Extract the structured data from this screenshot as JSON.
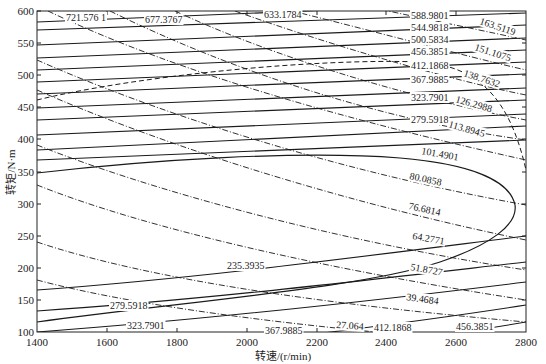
{
  "chart_data": {
    "type": "contour",
    "title": "",
    "xlabel": "转速/(r/min)",
    "ylabel": "转矩/N·m",
    "xlim": [
      1400,
      2800
    ],
    "ylim": [
      100,
      600
    ],
    "xticks": [
      1400,
      1600,
      1800,
      2000,
      2200,
      2400,
      2600,
      2800
    ],
    "yticks": [
      100,
      150,
      200,
      250,
      300,
      350,
      400,
      450,
      500,
      550,
      600
    ],
    "grid": false,
    "series": [
      {
        "name": "solid-contours",
        "style": "solid",
        "levels": [
          721.5761,
          677.3767,
          633.1784,
          588.9801,
          544.9818,
          500.5834,
          456.3851,
          412.1868,
          367.9885,
          323.7901,
          279.5918,
          235.3935
        ],
        "labels": [
          {
            "text": "721.576 1",
            "x": 1650,
            "y": 593
          },
          {
            "text": "677.3767",
            "x": 1950,
            "y": 585
          },
          {
            "text": "633.1784",
            "x": 2200,
            "y": 592
          },
          {
            "text": "588.9801",
            "x": 2480,
            "y": 587
          },
          {
            "text": "544.9818",
            "x": 2480,
            "y": 565
          },
          {
            "text": "500.5834",
            "x": 2480,
            "y": 542
          },
          {
            "text": "456.3851",
            "x": 2480,
            "y": 518
          },
          {
            "text": "412.1868",
            "x": 2480,
            "y": 493
          },
          {
            "text": "367.9885",
            "x": 2480,
            "y": 470
          },
          {
            "text": "323.7901",
            "x": 2480,
            "y": 440
          },
          {
            "text": "279.5918",
            "x": 2480,
            "y": 408
          },
          {
            "text": "235.3935",
            "x": 2000,
            "y": 198
          },
          {
            "text": "279.5918",
            "x": 1650,
            "y": 147
          },
          {
            "text": "323.7901",
            "x": 1700,
            "y": 113
          },
          {
            "text": "367.9885",
            "x": 2160,
            "y": 107
          },
          {
            "text": "412.1868",
            "x": 2410,
            "y": 110
          },
          {
            "text": "456.3851",
            "x": 2650,
            "y": 110
          }
        ]
      },
      {
        "name": "dashdot-contours",
        "style": "dash-dot",
        "levels": [
          163.5119,
          151.1075,
          138.7632,
          126.2988,
          113.8945,
          101.4901,
          80.0858,
          76.6814,
          64.2771,
          51.8727,
          39.4684,
          27.064
        ],
        "labels": [
          {
            "text": "163.5119",
            "x": 2710,
            "y": 585
          },
          {
            "text": "151.1075",
            "x": 2700,
            "y": 524
          },
          {
            "text": "138.7632",
            "x": 2680,
            "y": 483
          },
          {
            "text": "126.2988",
            "x": 2680,
            "y": 437
          },
          {
            "text": "113.8945",
            "x": 2660,
            "y": 396
          },
          {
            "text": "101.4901",
            "x": 2520,
            "y": 359
          },
          {
            "text": "80.0858",
            "x": 2460,
            "y": 316
          },
          {
            "text": "76.6814",
            "x": 2500,
            "y": 267
          },
          {
            "text": "64.2771",
            "x": 2520,
            "y": 236
          },
          {
            "text": "51.8727",
            "x": 2500,
            "y": 195
          },
          {
            "text": "39.4684",
            "x": 2460,
            "y": 154
          },
          {
            "text": "27.064",
            "x": 2250,
            "y": 112
          }
        ]
      },
      {
        "name": "boundary",
        "style": "dashed",
        "description": "dashed boundary curve from (1400,470) to upper right, dropping toward (2800,280)"
      },
      {
        "name": "efficiency-island",
        "style": "solid",
        "description": "closed loop from (1400,350) peaking ~385 around 2200, turning at ~2740 rpm, returning lower-left"
      }
    ]
  },
  "axes": {
    "x_title": "转速/(r/min)",
    "y_title": "转矩/N·m",
    "x_ticks": [
      "1400",
      "1600",
      "1800",
      "2000",
      "2200",
      "2400",
      "2600",
      "2800"
    ],
    "y_ticks": [
      "100",
      "150",
      "200",
      "250",
      "300",
      "350",
      "400",
      "450",
      "500",
      "550",
      "600"
    ]
  },
  "labels": {
    "s721": "721.576 1",
    "s677": "677.3767",
    "s633": "633.1784",
    "s588": "588.9801",
    "s544": "544.9818",
    "s500": "500.5834",
    "s456": "456.3851",
    "s412": "412.1868",
    "s367": "367.9885",
    "s323": "323.7901",
    "s279": "279.5918",
    "s235": "235.3935",
    "b279": "279.5918",
    "b323": "323.7901",
    "b367": "367.9885",
    "b412": "412.1868",
    "b456": "456.3851",
    "d163": "163.5119",
    "d151": "151.1075",
    "d138": "138.7632",
    "d126": "126.2988",
    "d113": "113.8945",
    "d101": "101.4901",
    "d80": "80.0858",
    "d76": "76.6814",
    "d64": "64.2771",
    "d51": "51.8727",
    "d39": "39.4684",
    "d27": "27.064"
  }
}
